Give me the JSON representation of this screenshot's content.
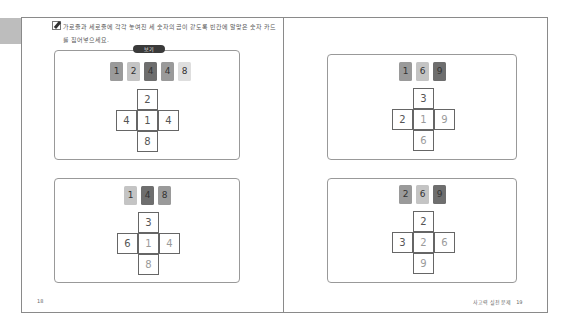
{
  "instruction": {
    "icon": "pencil-icon",
    "text": "가로줄과 세로줄에 각각 놓여진 세 숫자의 곱이 같도록 빈칸에 알맞은 숫자 카드를 집어넣으세요."
  },
  "example_label": "보기",
  "colors": {
    "card_dark": "#6e6e6e",
    "card_mid": "#9a9a9a",
    "card_light": "#c4c4c4",
    "card_lightest": "#dedede",
    "tab": "#bdbdbd",
    "frame": "#8a8a8a"
  },
  "puzzles": [
    {
      "id": "example",
      "cards": [
        {
          "value": "1",
          "shade": "mid"
        },
        {
          "value": "2",
          "shade": "light"
        },
        {
          "value": "4",
          "shade": "dark"
        },
        {
          "value": "4",
          "shade": "mid"
        },
        {
          "value": "8",
          "shade": "lightest"
        }
      ],
      "cross": {
        "top": "2",
        "left": "4",
        "center": "1",
        "right": "4",
        "bottom": "8"
      }
    },
    {
      "id": "left-bottom",
      "cards": [
        {
          "value": "1",
          "shade": "light"
        },
        {
          "value": "4",
          "shade": "dark"
        },
        {
          "value": "8",
          "shade": "mid"
        }
      ],
      "cross": {
        "top": "3",
        "left": "6",
        "center": "1",
        "right": "4",
        "bottom": "8"
      }
    },
    {
      "id": "right-top",
      "cards": [
        {
          "value": "1",
          "shade": "mid"
        },
        {
          "value": "6",
          "shade": "light"
        },
        {
          "value": "9",
          "shade": "dark"
        }
      ],
      "cross": {
        "top": "3",
        "left": "2",
        "center": "1",
        "right": "9",
        "bottom": "6"
      }
    },
    {
      "id": "right-bottom",
      "cards": [
        {
          "value": "2",
          "shade": "mid"
        },
        {
          "value": "6",
          "shade": "light"
        },
        {
          "value": "9",
          "shade": "dark"
        }
      ],
      "cross": {
        "top": "2",
        "left": "3",
        "center": "2",
        "right": "6",
        "bottom": "9"
      }
    }
  ],
  "footer": {
    "left_page": "18",
    "right_title": "사고력 실전 문제",
    "right_page": "19"
  }
}
